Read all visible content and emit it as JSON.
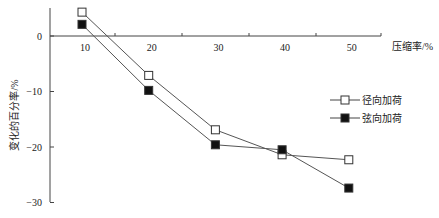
{
  "chart_data": {
    "type": "line",
    "title": "",
    "xlabel": "压缩率/%",
    "ylabel": "变化的百分率/%",
    "categories": [
      10,
      20,
      30,
      40,
      50
    ],
    "x": [
      10,
      20,
      30,
      40,
      50
    ],
    "ylim": [
      -30,
      5
    ],
    "yticks": [
      0,
      -10,
      -20,
      -30
    ],
    "xticks": [
      10,
      20,
      30,
      40,
      50
    ],
    "grid": false,
    "legend_position": "right-center",
    "series": [
      {
        "name": "径向加荷",
        "marker": "open-square",
        "color": "#333333",
        "values": [
          4.3,
          -7.1,
          -16.9,
          -21.4,
          -22.3
        ]
      },
      {
        "name": "弦向加荷",
        "marker": "filled-square",
        "color": "#111111",
        "values": [
          2.1,
          -9.8,
          -19.6,
          -20.5,
          -27.4
        ]
      }
    ]
  }
}
